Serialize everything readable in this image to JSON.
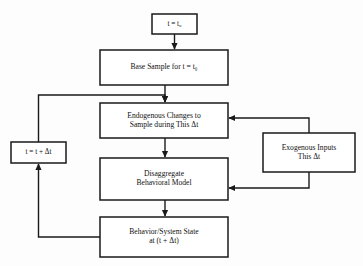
{
  "diagram": {
    "background_color": "#fdfdfd",
    "stroke_color": "#1a1a1a",
    "text_color": "#111111",
    "nodes": [
      {
        "id": "init-time",
        "name": "initial-time-node",
        "label": "t = t₀",
        "x": 152,
        "y": 14,
        "width": 45,
        "height": 20
      },
      {
        "id": "base-sample",
        "name": "base-sample-node",
        "label": "Base Sample for t = t₀",
        "x": 100,
        "y": 50,
        "width": 128,
        "height": 35
      },
      {
        "id": "endogenous-changes",
        "name": "endogenous-changes-node",
        "label": "Endogenous Changes to\nSample during This Δt",
        "x": 100,
        "y": 103,
        "width": 128,
        "height": 35
      },
      {
        "id": "time-increment",
        "name": "time-increment-node",
        "label": "t = t + Δt",
        "x": 11,
        "y": 142,
        "width": 55,
        "height": 21
      },
      {
        "id": "disaggregate-model",
        "name": "disaggregate-behavioral-model-node",
        "label": "Disaggregate\nBehavioral Model",
        "x": 100,
        "y": 158,
        "width": 128,
        "height": 42
      },
      {
        "id": "exogenous-inputs",
        "name": "exogenous-inputs-node",
        "label": "Exogenous Inputs\nThis Δt",
        "x": 263,
        "y": 133,
        "width": 92,
        "height": 39
      },
      {
        "id": "behavior-system-state",
        "name": "behavior-system-state-node",
        "label": "Behavior/System State\nat (t + Δt)",
        "x": 100,
        "y": 217,
        "width": 128,
        "height": 40
      }
    ],
    "edges": [
      {
        "id": "e1",
        "name": "edge-init-to-base-sample",
        "from": "init-time",
        "to": "base-sample"
      },
      {
        "id": "e2",
        "name": "edge-base-sample-to-endogenous",
        "from": "base-sample",
        "to": "endogenous-changes"
      },
      {
        "id": "e3",
        "name": "edge-endogenous-to-disaggregate",
        "from": "endogenous-changes",
        "to": "disaggregate-model"
      },
      {
        "id": "e4",
        "name": "edge-disaggregate-to-behavior",
        "from": "disaggregate-model",
        "to": "behavior-system-state"
      },
      {
        "id": "e5",
        "name": "edge-behavior-to-time-increment",
        "from": "behavior-system-state",
        "to": "time-increment"
      },
      {
        "id": "e6",
        "name": "edge-time-increment-to-endogenous",
        "from": "time-increment",
        "to": "endogenous-changes"
      },
      {
        "id": "e7",
        "name": "edge-exogenous-to-endogenous",
        "from": "exogenous-inputs",
        "to": "endogenous-changes"
      },
      {
        "id": "e8",
        "name": "edge-exogenous-to-disaggregate",
        "from": "exogenous-inputs",
        "to": "disaggregate-model"
      }
    ]
  }
}
